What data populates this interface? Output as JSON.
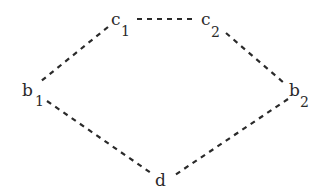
{
  "diagram": {
    "type": "graph",
    "style": "dashed-edges",
    "nodes": [
      {
        "id": "c1",
        "base": "c",
        "sub": "1",
        "x": 111,
        "y": 24
      },
      {
        "id": "c2",
        "base": "c",
        "sub": "2",
        "x": 201,
        "y": 24
      },
      {
        "id": "b1",
        "base": "b",
        "sub": "1",
        "x": 22,
        "y": 96
      },
      {
        "id": "b2",
        "base": "b",
        "sub": "2",
        "x": 290,
        "y": 96
      },
      {
        "id": "d",
        "base": "d",
        "sub": "",
        "x": 156,
        "y": 186
      }
    ],
    "edges": [
      {
        "from": "c1",
        "to": "c2"
      },
      {
        "from": "c1",
        "to": "b1"
      },
      {
        "from": "c2",
        "to": "b2"
      },
      {
        "from": "b1",
        "to": "d"
      },
      {
        "from": "b2",
        "to": "d"
      }
    ]
  },
  "labels": {
    "c1": {
      "base": "c",
      "sub": "1"
    },
    "c2": {
      "base": "c",
      "sub": "2"
    },
    "b1": {
      "base": "b",
      "sub": "1"
    },
    "b2": {
      "base": "b",
      "sub": "2"
    },
    "d": {
      "base": "d"
    }
  },
  "colors": {
    "ink": "#2a2a2a",
    "background": "#ffffff"
  }
}
